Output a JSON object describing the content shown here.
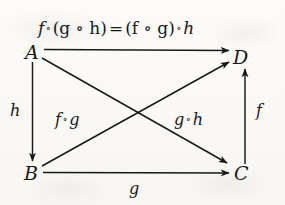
{
  "figure": {
    "kind": "commutative-diagram",
    "equation": {
      "lhs_fn": "f",
      "lhs_group": "(g ∘ h)",
      "relation": "=",
      "rhs_group": "(f ∘ g)",
      "rhs_fn": "h",
      "full_text": "f ∘ (g ∘ h) = (f ∘ g) ∘ h",
      "operator": "∘"
    },
    "vertices": [
      {
        "id": "A",
        "label": "A",
        "x": 33,
        "y": 52
      },
      {
        "id": "D",
        "label": "D",
        "x": 240,
        "y": 57
      },
      {
        "id": "B",
        "label": "B",
        "x": 32,
        "y": 173
      },
      {
        "id": "C",
        "label": "C",
        "x": 241,
        "y": 173
      }
    ],
    "edges": [
      {
        "id": "A-to-D",
        "from": "A",
        "to": "D",
        "label": "",
        "label_text": "",
        "direction": "right"
      },
      {
        "id": "A-to-B",
        "from": "A",
        "to": "B",
        "label": "h",
        "label_text": "h",
        "direction": "down"
      },
      {
        "id": "B-to-C",
        "from": "B",
        "to": "C",
        "label": "g",
        "label_text": "g",
        "direction": "right"
      },
      {
        "id": "C-to-D",
        "from": "C",
        "to": "D",
        "label": "f",
        "label_text": "f",
        "direction": "up"
      },
      {
        "id": "A-to-C",
        "from": "A",
        "to": "C",
        "label": "g ∘ h",
        "label_text": "g ∘ h",
        "direction": "diagonal-down-right"
      },
      {
        "id": "B-to-D",
        "from": "B",
        "to": "D",
        "label": "f ∘ g",
        "label_text": "f ∘ g",
        "direction": "diagonal-up-right"
      }
    ],
    "edge_labels": {
      "h": "h",
      "g": "g",
      "f": "f",
      "f_comp_g_left": "f",
      "f_comp_g_right": "g",
      "g_comp_h_left": "g",
      "g_comp_h_right": "h"
    },
    "colors": {
      "ink": "#18181a",
      "paper": "#fbfaf8"
    }
  }
}
